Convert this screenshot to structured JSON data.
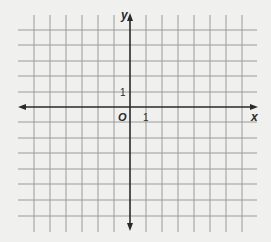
{
  "diagram": {
    "type": "coordinate-grid",
    "background": "#f0f0ee",
    "grid_color": "#9a9a9a",
    "axis_color": "#2a2a2a",
    "x_axis_label": "x",
    "y_axis_label": "y",
    "origin_label": "O",
    "x_unit_label": "1",
    "y_unit_label": "1",
    "grid": {
      "vertical_lines_x": [
        34,
        50,
        66,
        82,
        98,
        114,
        130,
        146,
        162,
        178,
        194,
        210,
        226,
        242
      ],
      "horizontal_lines_y": [
        30,
        45,
        61,
        76,
        92,
        107,
        122,
        138,
        153,
        169,
        184,
        200,
        216
      ],
      "v_top": 15,
      "v_bottom": 232,
      "h_left": 18,
      "h_right": 257
    },
    "axes": {
      "origin_x": 130,
      "origin_y": 107,
      "x_min_px": 18,
      "x_max_px": 258,
      "y_min_px": 13,
      "y_max_px": 231
    }
  }
}
